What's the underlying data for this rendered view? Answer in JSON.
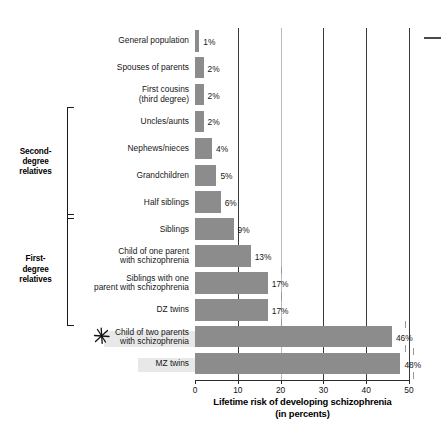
{
  "chart_data": {
    "type": "bar",
    "orientation": "horizontal",
    "title": "",
    "xlabel": "Lifetime risk of developing schizophrenia (in percents)",
    "xlabel_line1": "Lifetime risk of developing schizophrenia",
    "xlabel_line2": "(in percents)",
    "ylabel": "",
    "xlim": [
      0,
      50
    ],
    "xticks": [
      0,
      10,
      20,
      30,
      40,
      50
    ],
    "xticklabels": [
      "0",
      "10",
      "20",
      "30",
      "40",
      "50"
    ],
    "grid": true,
    "legend": "none",
    "bar_color": "#8c8c8c",
    "categories": [
      "General population",
      "Spouses of parents",
      "First cousins\n(third degree)",
      "Uncles/aunts",
      "Nephews/nieces",
      "Grandchildren",
      "Half siblings",
      "Siblings",
      "Child of one parent\nwith schizophrenia",
      "Siblings with one\nparent with schizophrenia",
      "DZ twins",
      "Child of two parents\nwith schizophrenia",
      "MZ twins"
    ],
    "values": [
      1,
      2,
      2,
      2,
      4,
      5,
      6,
      9,
      13,
      17,
      17,
      46,
      48
    ],
    "value_labels": [
      "1%",
      "2%",
      "2%",
      "2%",
      "4%",
      "5%",
      "6%",
      "9%",
      "13%",
      "17%",
      "17%",
      "46%",
      "48%"
    ]
  },
  "groups": [
    {
      "name": "second-degree",
      "label_line1": "Second-",
      "label_line2": "degree",
      "label_line3": "relatives",
      "first_index": 3,
      "last_index": 6
    },
    {
      "name": "first-degree",
      "label_line1": "First-",
      "label_line2": "degree",
      "label_line3": "relatives",
      "first_index": 7,
      "last_index": 10
    }
  ],
  "annotations": [
    {
      "name": "star-marker",
      "glyph": "star-asterisk-icon",
      "target_category": "Child of two parents\nwith schizophrenia"
    }
  ]
}
